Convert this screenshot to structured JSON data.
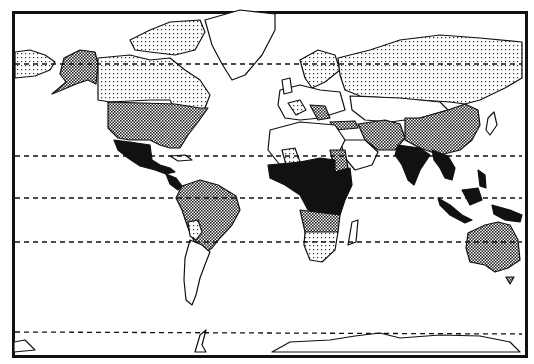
{
  "map": {
    "type": "choropleth world map",
    "projection": "Mercator-like",
    "style": "monochrome pattern fill",
    "colors": {
      "ink": "#111111",
      "background": "#ffffff"
    },
    "fill_classes": [
      {
        "id": "solid",
        "pattern": "solid black"
      },
      {
        "id": "dense",
        "pattern": "dense checker dots (dark gray)"
      },
      {
        "id": "light",
        "pattern": "sparse dots (light gray)"
      },
      {
        "id": "none",
        "pattern": "white / unfilled"
      }
    ],
    "reference_lines": [
      {
        "name": "Arctic Circle",
        "y": 64
      },
      {
        "name": "Tropic of Cancer",
        "y": 156
      },
      {
        "name": "Equator",
        "y": 198
      },
      {
        "name": "Tropic of Capricorn",
        "y": 242
      },
      {
        "name": "Antarctic Circle",
        "y": 332
      }
    ],
    "regions": {
      "solid": [
        "Mexico",
        "Central America",
        "Central Africa",
        "West Africa",
        "Ethiopia",
        "India",
        "Southeast Asia",
        "Indonesia",
        "Papua New Guinea"
      ],
      "dense": [
        "Alaska",
        "United States",
        "South America (north & Brazil)",
        "Sudan",
        "Southern Africa (north)",
        "Middle East / Iran / Afghanistan",
        "China",
        "Australia",
        "Turkey",
        "Balkans"
      ],
      "light": [
        "Canada",
        "Russia",
        "Eastern Siberia",
        "Scandinavia",
        "France",
        "Bolivia",
        "Mali",
        "South Africa"
      ],
      "none": [
        "Greenland",
        "Western Europe (parts)",
        "North Africa",
        "Argentina",
        "Mongolia",
        "Kazakhstan",
        "Japan",
        "Madagascar",
        "Antarctica"
      ]
    }
  }
}
